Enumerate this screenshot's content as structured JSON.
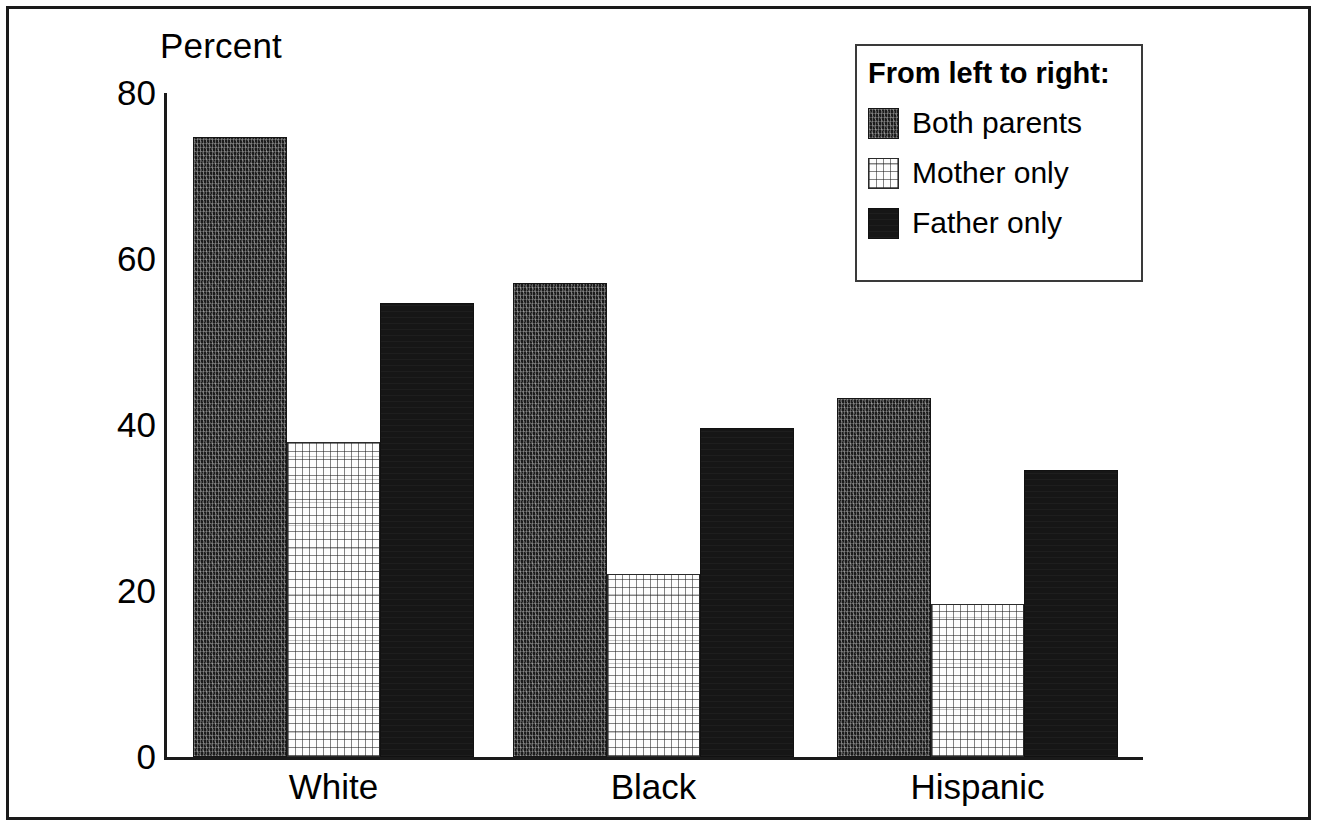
{
  "chart_data": {
    "type": "bar",
    "title": "",
    "xlabel": "",
    "ylabel": "Percent",
    "ylim": [
      0,
      80
    ],
    "yticks": [
      "0",
      "20",
      "40",
      "60",
      "80"
    ],
    "grid": false,
    "legend_position": "top-right",
    "legend_title": "From left to right:",
    "categories": [
      "White",
      "Black",
      "Hispanic"
    ],
    "series": [
      {
        "name": "Both parents",
        "fill": "dark-speckle",
        "values": [
          74.7,
          57.1,
          43.2
        ]
      },
      {
        "name": "Mother only",
        "fill": "light-crosshatch",
        "values": [
          38.0,
          22.0,
          18.4
        ]
      },
      {
        "name": "Father only",
        "fill": "solid-black",
        "values": [
          54.7,
          39.6,
          34.6
        ]
      }
    ]
  },
  "axis": {
    "y_title": "Percent",
    "ticks": [
      {
        "label": "80",
        "value": 80
      },
      {
        "label": "60",
        "value": 60
      },
      {
        "label": "40",
        "value": 40
      },
      {
        "label": "20",
        "value": 20
      },
      {
        "label": "0",
        "value": 0
      }
    ]
  },
  "legend": {
    "title": "From left to right:",
    "items": [
      {
        "label": "Both parents",
        "swatch": "dark-speckle-swatch"
      },
      {
        "label": "Mother only",
        "swatch": "light-crosshatch-swatch"
      },
      {
        "label": "Father only",
        "swatch": "solid-black-swatch"
      }
    ]
  },
  "colors": {
    "ink": "#1a1a1a",
    "background": "#ffffff",
    "bar_dark": "#1c1c1c",
    "bar_light": "#fdfdfd",
    "bar_solid": "#161616"
  }
}
